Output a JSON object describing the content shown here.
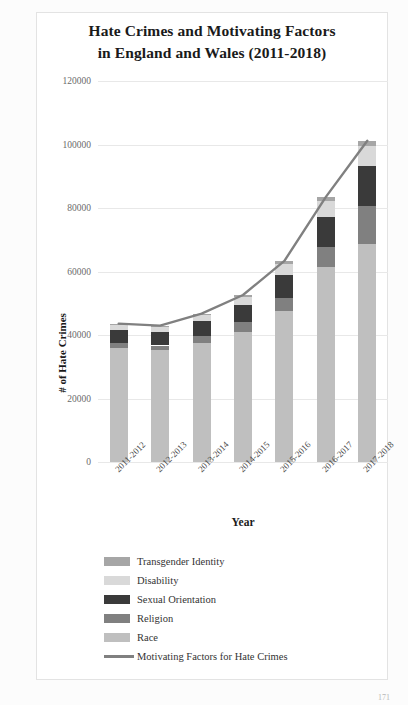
{
  "chart_data": {
    "type": "bar",
    "stacked": true,
    "title": "Hate Crimes and Motivating Factors in England and Wales (2011-2018)",
    "title_line1": "Hate Crimes and Motivating Factors",
    "title_line2": "in England and Wales (2011-2018)",
    "xlabel": "Year",
    "ylabel": "# of Hate Crimes",
    "ylim": [
      0,
      120000
    ],
    "ytick_values": [
      0,
      20000,
      40000,
      60000,
      80000,
      100000,
      120000
    ],
    "ytick_labels": [
      "0",
      "20000",
      "40000",
      "60000",
      "80000",
      "100000",
      "120000"
    ],
    "grid": true,
    "legend_position": "bottom",
    "categories": [
      "2011-2012",
      "2012-2013",
      "2013-2014",
      "2014-2015",
      "2015-2016",
      "2016-2017",
      "2017-2018"
    ],
    "series": [
      {
        "name": "Race",
        "color": "#bfbfbf",
        "values": [
          35800,
          35200,
          37500,
          41000,
          47700,
          61300,
          68800
        ]
      },
      {
        "name": "Religion",
        "color": "#808080",
        "values": [
          1600,
          1500,
          2300,
          3200,
          4100,
          6400,
          11800
        ]
      },
      {
        "name": "Sexual Orientation",
        "color": "#3a3a3a",
        "values": [
          4200,
          4100,
          4500,
          5300,
          7100,
          9400,
          12600
        ]
      },
      {
        "name": "Disability",
        "color": "#d9d9d9",
        "values": [
          1700,
          1800,
          1900,
          2500,
          3600,
          5200,
          6300
        ]
      },
      {
        "name": "Transgender Identity",
        "color": "#a6a6a6",
        "values": [
          300,
          350,
          550,
          600,
          850,
          1200,
          1700
        ]
      }
    ],
    "line_series": {
      "name": "Motivating Factors for Hate Crimes",
      "color": "#808080",
      "values": [
        43600,
        42950,
        46750,
        52600,
        63350,
        83500,
        101200
      ]
    }
  },
  "legend": {
    "items": [
      {
        "label": "Transgender Identity",
        "color": "#a6a6a6",
        "kind": "swatch"
      },
      {
        "label": "Disability",
        "color": "#d9d9d9",
        "kind": "swatch"
      },
      {
        "label": "Sexual Orientation",
        "color": "#3a3a3a",
        "kind": "swatch"
      },
      {
        "label": "Religion",
        "color": "#808080",
        "kind": "swatch"
      },
      {
        "label": "Race",
        "color": "#bfbfbf",
        "kind": "swatch"
      },
      {
        "label": "Motivating Factors for Hate Crimes",
        "color": "#808080",
        "kind": "line"
      }
    ]
  },
  "page": {
    "number": "171"
  }
}
